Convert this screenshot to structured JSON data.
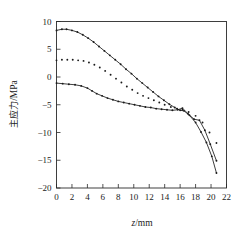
{
  "chart_data": {
    "type": "line",
    "title": "",
    "subtitle": "",
    "xlabel": "z/mm",
    "xlabel_italic_part": "z",
    "xlabel_rest": "/mm",
    "ylabel": "主应力/MPa",
    "ylabel_cjk_part": "主应力",
    "ylabel_unit_part": "/MPa",
    "xlim": [
      0,
      22
    ],
    "ylim": [
      -20,
      10
    ],
    "xticks": [
      0,
      2,
      4,
      6,
      8,
      10,
      12,
      14,
      16,
      18,
      20,
      22
    ],
    "xtick_labels": [
      "0",
      "2",
      "4",
      "6",
      "8",
      "10",
      "12",
      "14",
      "16",
      "18",
      "20",
      "22"
    ],
    "yticks": [
      -20,
      -15,
      -10,
      -5,
      0,
      5,
      10
    ],
    "ytick_labels": [
      "−20",
      "−15",
      "−10",
      "−5",
      "0",
      "5",
      "10"
    ],
    "grid": false,
    "legend": "none",
    "axis_color": "#2a2a2a",
    "series_color": "#1a1a1a",
    "series": [
      {
        "name": "upper-curve",
        "style": "line-with-markers",
        "marker": "dot",
        "x": [
          0.0,
          0.7,
          1.3,
          2.0,
          2.7,
          3.4,
          4.1,
          4.8,
          5.5,
          6.2,
          6.9,
          7.6,
          8.3,
          9.0,
          9.7,
          10.4,
          11.1,
          11.8,
          12.5,
          13.2,
          13.9,
          14.6,
          15.3,
          16.0,
          16.5,
          17.2,
          18.0,
          18.7,
          19.4,
          20.1,
          20.7
        ],
        "y": [
          8.4,
          8.6,
          8.6,
          8.4,
          8.1,
          7.6,
          7.0,
          6.3,
          5.5,
          4.7,
          3.9,
          3.1,
          2.3,
          1.4,
          0.6,
          -0.3,
          -1.1,
          -1.9,
          -2.7,
          -3.5,
          -4.2,
          -4.9,
          -5.5,
          -6.0,
          -6.1,
          -6.9,
          -8.2,
          -9.9,
          -11.8,
          -14.3,
          -17.3
        ]
      },
      {
        "name": "middle-curve",
        "style": "markers-only",
        "marker": "dot",
        "x": [
          0.0,
          0.7,
          1.4,
          2.1,
          2.8,
          3.5,
          4.2,
          4.9,
          5.6,
          6.3,
          7.0,
          7.7,
          8.4,
          9.1,
          9.8,
          10.5,
          11.2,
          11.9,
          12.6,
          13.3,
          14.0,
          14.8,
          15.6,
          16.3,
          17.1,
          18.0,
          18.9,
          19.8,
          20.7
        ],
        "y": [
          3.0,
          3.1,
          3.1,
          3.1,
          3.0,
          2.9,
          2.6,
          2.2,
          1.7,
          1.1,
          0.4,
          -0.3,
          -1.0,
          -1.7,
          -2.3,
          -2.9,
          -3.4,
          -3.8,
          -4.2,
          -4.6,
          -5.0,
          -5.4,
          -5.7,
          -5.9,
          -6.3,
          -7.0,
          -8.2,
          -10.0,
          -11.9
        ]
      },
      {
        "name": "lower-curve",
        "style": "line-with-markers",
        "marker": "dot",
        "x": [
          0.0,
          0.8,
          1.6,
          2.4,
          3.2,
          4.0,
          4.6,
          5.2,
          5.9,
          6.6,
          7.3,
          8.0,
          8.7,
          9.4,
          10.1,
          10.8,
          11.5,
          12.2,
          12.9,
          13.6,
          14.3,
          15.0,
          15.7,
          16.3,
          17.0,
          17.8,
          18.5,
          19.2,
          19.9,
          20.7
        ],
        "y": [
          -1.1,
          -1.2,
          -1.3,
          -1.4,
          -1.6,
          -2.0,
          -2.5,
          -3.0,
          -3.4,
          -3.8,
          -4.1,
          -4.4,
          -4.6,
          -4.8,
          -5.0,
          -5.2,
          -5.4,
          -5.5,
          -5.7,
          -5.8,
          -5.9,
          -6.0,
          -5.9,
          -5.6,
          -6.6,
          -7.6,
          -7.8,
          -9.6,
          -12.1,
          -15.1
        ]
      }
    ]
  },
  "figure": {
    "caption": ""
  }
}
